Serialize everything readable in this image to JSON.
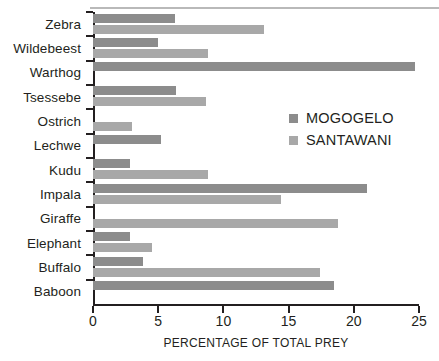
{
  "chart_data": {
    "type": "bar",
    "orientation": "horizontal",
    "title": "",
    "xlabel": "PERCENTAGE OF TOTAL PREY",
    "ylabel": "",
    "xlim": [
      0,
      25
    ],
    "xticks": [
      0,
      5,
      10,
      15,
      20,
      25
    ],
    "xtick_labels": [
      "0",
      "5",
      "10",
      "15",
      "20",
      "25"
    ],
    "grid": false,
    "legend_position": "center-right",
    "categories": [
      "Zebra",
      "Wildebeest",
      "Warthog",
      "Tsessebe",
      "Ostrich",
      "Lechwe",
      "Kudu",
      "Impala",
      "Giraffe",
      "Elephant",
      "Buffalo",
      "Baboon"
    ],
    "series": [
      {
        "name": "MOGOGELO",
        "color": "#8c8c8c",
        "values": [
          6.3,
          5.0,
          24.7,
          6.4,
          0,
          5.2,
          2.8,
          21.0,
          0,
          2.8,
          3.8,
          18.5
        ]
      },
      {
        "name": "SANTAWANI",
        "color": "#a8a8a8",
        "values": [
          13.1,
          8.8,
          0,
          8.7,
          3.0,
          0,
          8.8,
          14.4,
          18.8,
          4.5,
          17.4,
          0
        ]
      }
    ]
  },
  "legend": {
    "items": [
      {
        "label": "MOGOGELO",
        "swatch": "mog"
      },
      {
        "label": "SANTAWANI",
        "swatch": "san"
      }
    ]
  }
}
